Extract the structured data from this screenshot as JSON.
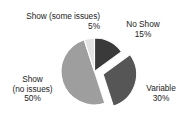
{
  "chart_data": {
    "type": "pie",
    "title": "",
    "subtitle": "",
    "xlabel": "",
    "ylabel": "",
    "legend": "none",
    "grid": false,
    "labels_position": "outside",
    "exploded_slices": [
      "Variable"
    ],
    "start_angle_deg": 0,
    "direction": "clockwise",
    "categories": [
      "No Show",
      "Variable",
      "Show (no issues)",
      "Show (some issues)"
    ],
    "values": [
      15,
      30,
      50,
      5
    ],
    "value_unit": "%",
    "colors": [
      "#3a3a3a",
      "#565656",
      "#9e9e9e",
      "#e2e2e2"
    ],
    "slices": [
      {
        "name": "No Show",
        "value": 15,
        "value_text": "15%",
        "color": "#3a3a3a",
        "exploded": false,
        "start_deg": 0,
        "end_deg": 54
      },
      {
        "name": "Variable",
        "value": 30,
        "value_text": "30%",
        "color": "#565656",
        "exploded": true,
        "start_deg": 54,
        "end_deg": 162
      },
      {
        "name": "Show (no issues)",
        "value": 50,
        "value_text": "50%",
        "color": "#9e9e9e",
        "exploded": false,
        "start_deg": 162,
        "end_deg": 342
      },
      {
        "name": "Show (some issues)",
        "value": 5,
        "value_text": "5%",
        "color": "#e2e2e2",
        "exploded": false,
        "start_deg": 342,
        "end_deg": 360
      }
    ]
  },
  "labels": {
    "show_some_issues": {
      "name": "Show (some issues)",
      "value": "5%"
    },
    "no_show": {
      "name": "No Show",
      "value": "15%"
    },
    "variable": {
      "name": "Variable",
      "value": "30%"
    },
    "show_no_issues": {
      "name_line1": "Show",
      "name_line2": "(no issues)",
      "value": "50%"
    }
  },
  "style": {
    "background": "#ffffff",
    "text_color": "#1c1c1c",
    "slice_edge_color": "#ffffff"
  }
}
